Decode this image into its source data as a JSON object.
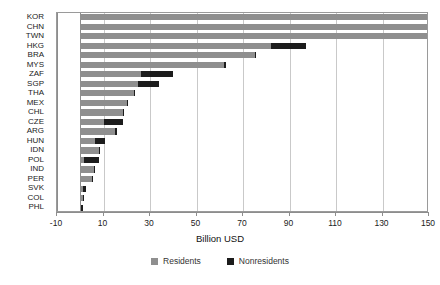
{
  "chart_data": {
    "type": "bar",
    "orientation": "horizontal",
    "stacked": true,
    "title": "",
    "xlabel": "Billion USD",
    "ylabel": "",
    "xlim": [
      -10,
      150
    ],
    "xticks": [
      -10,
      10,
      30,
      50,
      70,
      90,
      110,
      130,
      150
    ],
    "xticklabels": [
      "-10",
      "10",
      "30",
      "50",
      "70",
      "90",
      "110",
      "130",
      "150"
    ],
    "grid": true,
    "legend_position": "bottom",
    "categories": [
      "KOR",
      "CHN",
      "TWN",
      "HKG",
      "BRA",
      "MYS",
      "ZAF",
      "SGP",
      "THA",
      "MEX",
      "CHL",
      "CZE",
      "ARG",
      "HUN",
      "IDN",
      "POL",
      "IND",
      "PER",
      "SVK",
      "COL",
      "PHL"
    ],
    "series": [
      {
        "name": "Residents",
        "color": "#8f8f8f",
        "values": [
          150.0,
          149.0,
          149.0,
          82.0,
          75.0,
          62.0,
          26.0,
          25.0,
          23.0,
          20.0,
          18.5,
          10.0,
          15.0,
          6.5,
          8.0,
          1.5,
          6.0,
          5.0,
          1.0,
          1.0,
          0.5
        ]
      },
      {
        "name": "Nonresidents",
        "color": "#1c1c1c",
        "values": [
          1.0,
          1.0,
          1.0,
          15.0,
          0.5,
          0.5,
          14.0,
          9.0,
          0.5,
          0.5,
          0.3,
          8.5,
          1.0,
          4.0,
          0.3,
          6.5,
          0.3,
          0.3,
          1.5,
          0.5,
          0.5
        ]
      }
    ],
    "totals": [
      151.0,
      150.0,
      150.0,
      97.0,
      75.5,
      62.5,
      40.0,
      34.0,
      23.5,
      20.5,
      18.8,
      18.5,
      16.0,
      10.5,
      8.3,
      8.0,
      6.3,
      5.3,
      2.5,
      1.5,
      1.0
    ]
  },
  "legend": {
    "items": [
      {
        "label": "Residents"
      },
      {
        "label": "Nonresidents"
      }
    ]
  }
}
